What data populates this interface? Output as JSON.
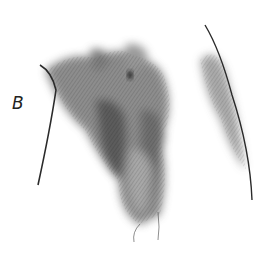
{
  "figure": {
    "label": "B",
    "ink_color": "#2a2a2a",
    "paper_color": "#ffffff"
  }
}
